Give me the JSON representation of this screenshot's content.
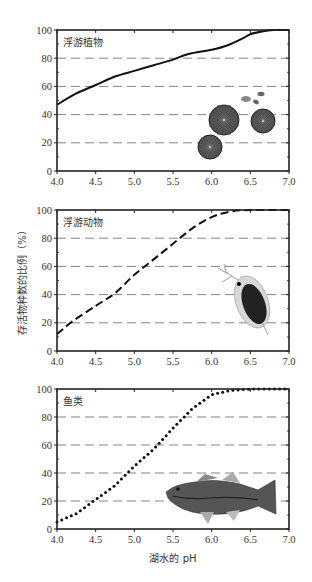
{
  "figure": {
    "ylabel": "存活物种数的比例（%）",
    "xlabel": "湖水的 pH"
  },
  "chart_data": [
    {
      "type": "line",
      "title": "浮游植物",
      "line_style": "solid",
      "x": [
        4.0,
        4.25,
        4.5,
        4.75,
        5.0,
        5.25,
        5.5,
        5.7,
        6.0,
        6.2,
        6.4,
        6.5,
        6.65,
        6.8,
        7.0
      ],
      "values": [
        47,
        55,
        61,
        67,
        71,
        75,
        79,
        83,
        86,
        89,
        94,
        97,
        99,
        100,
        100
      ],
      "xlabel": "",
      "ylabel": "",
      "xlim": [
        4.0,
        7.0
      ],
      "ylim": [
        0,
        100
      ],
      "xticks": [
        "4.0",
        "4.5",
        "5.0",
        "5.5",
        "6.0",
        "6.5",
        "7.0"
      ],
      "yticks": [
        "0",
        "20",
        "40",
        "60",
        "80",
        "100"
      ],
      "grid": "horizontal dashed at 20,40,60,80",
      "illustration": "phytoplankton (diatoms)"
    },
    {
      "type": "line",
      "title": "浮游动物",
      "line_style": "dashed",
      "x": [
        4.0,
        4.2,
        4.5,
        4.75,
        5.0,
        5.25,
        5.5,
        5.75,
        6.0,
        6.25,
        6.5,
        7.0
      ],
      "values": [
        12,
        21,
        32,
        41,
        54,
        65,
        76,
        87,
        95,
        99,
        100,
        100
      ],
      "xlabel": "",
      "ylabel": "存活物种数的比例（%）",
      "xlim": [
        4.0,
        7.0
      ],
      "ylim": [
        0,
        100
      ],
      "xticks": [
        "4.0",
        "4.5",
        "5.0",
        "5.5",
        "6.0",
        "6.5",
        "7.0"
      ],
      "yticks": [
        "0",
        "20",
        "40",
        "60",
        "80",
        "100"
      ],
      "grid": "horizontal dashed at 20,40,60,80",
      "illustration": "zooplankton (daphnia)"
    },
    {
      "type": "line",
      "title": "鱼类",
      "line_style": "dotted",
      "x": [
        4.0,
        4.25,
        4.5,
        4.75,
        5.0,
        5.25,
        5.5,
        5.75,
        6.0,
        6.25,
        6.5,
        7.0
      ],
      "values": [
        5,
        11,
        21,
        31,
        45,
        57,
        72,
        86,
        96,
        99,
        100,
        100
      ],
      "xlabel": "湖水的 pH",
      "ylabel": "",
      "xlim": [
        4.0,
        7.0
      ],
      "ylim": [
        0,
        100
      ],
      "xticks": [
        "4.0",
        "4.5",
        "5.0",
        "5.5",
        "6.0",
        "6.5",
        "7.0"
      ],
      "yticks": [
        "0",
        "20",
        "40",
        "60",
        "80",
        "100"
      ],
      "grid": "horizontal dashed at 20,40,60,80",
      "illustration": "fish (bass)"
    }
  ]
}
